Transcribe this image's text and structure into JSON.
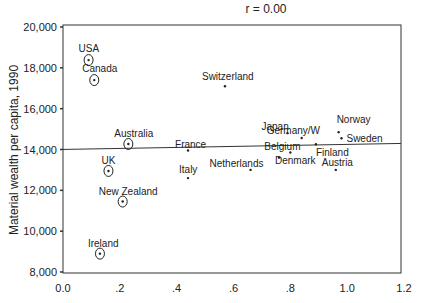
{
  "chart_data": {
    "type": "scatter",
    "title": "r = 0.00",
    "xlabel": "",
    "ylabel": "Material wealth per capita, 1990",
    "xlim": [
      0.0,
      1.2
    ],
    "ylim": [
      8000,
      20000
    ],
    "x_ticks": [
      0.0,
      0.2,
      0.4,
      0.6,
      0.8,
      1.0,
      1.2
    ],
    "x_tick_labels": [
      "0.0",
      ".2",
      ".4",
      ".6",
      ".8",
      "1.0",
      "1.2"
    ],
    "y_ticks": [
      8000,
      10000,
      12000,
      14000,
      16000,
      18000,
      20000
    ],
    "y_tick_labels": [
      "8,000",
      "10,000",
      "12,000",
      "14,000",
      "16,000",
      "18,000",
      "20,000"
    ],
    "grid": false,
    "regression_line": {
      "intercept": 14150,
      "slope": 0,
      "r": 0.0
    },
    "points": [
      {
        "label": "USA",
        "x": 0.09,
        "y": 18380,
        "circled": true
      },
      {
        "label": "Canada",
        "x": 0.11,
        "y": 17400,
        "circled": true
      },
      {
        "label": "Australia",
        "x": 0.23,
        "y": 14270,
        "circled": true
      },
      {
        "label": "UK",
        "x": 0.16,
        "y": 12950,
        "circled": true
      },
      {
        "label": "New Zealand",
        "x": 0.21,
        "y": 11450,
        "circled": true
      },
      {
        "label": "Ireland",
        "x": 0.13,
        "y": 8900,
        "circled": true
      },
      {
        "label": "Switzerland",
        "x": 0.57,
        "y": 17100,
        "circled": false
      },
      {
        "label": "France",
        "x": 0.44,
        "y": 13950,
        "circled": false
      },
      {
        "label": "Italy",
        "x": 0.44,
        "y": 12600,
        "circled": false
      },
      {
        "label": "Japan",
        "x": 0.79,
        "y": 14800,
        "circled": false
      },
      {
        "label": "Germany/W",
        "x": 0.84,
        "y": 14560,
        "circled": false
      },
      {
        "label": "Norway",
        "x": 0.97,
        "y": 14850,
        "circled": false
      },
      {
        "label": "Sweden",
        "x": 0.98,
        "y": 14550,
        "circled": false
      },
      {
        "label": "Finland",
        "x": 0.89,
        "y": 14260,
        "circled": false
      },
      {
        "label": "Belgium",
        "x": 0.8,
        "y": 13850,
        "circled": false
      },
      {
        "label": "Denmark",
        "x": 0.76,
        "y": 13600,
        "circled": false
      },
      {
        "label": "Netherlands",
        "x": 0.66,
        "y": 13000,
        "circled": false
      },
      {
        "label": "Austria",
        "x": 0.96,
        "y": 13000,
        "circled": false
      }
    ]
  }
}
